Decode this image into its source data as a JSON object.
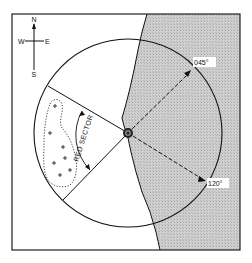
{
  "diagram": {
    "title": "",
    "type": "light sector chart",
    "compass": {
      "north": "N",
      "south": "S",
      "east": "E",
      "west": "W"
    },
    "bearings": [
      {
        "label": "045°",
        "degrees": 45
      },
      {
        "label": "120°",
        "degrees": 120
      }
    ],
    "sector": {
      "label": "RED SECTOR",
      "color_name": "red"
    },
    "hazard": {
      "symbol": "+",
      "count": 7,
      "description": "dotted outline enclosing rocks/obstructions"
    },
    "colors": {
      "land": "#c8c8c8",
      "water": "#ffffff",
      "ink": "#111111"
    }
  }
}
